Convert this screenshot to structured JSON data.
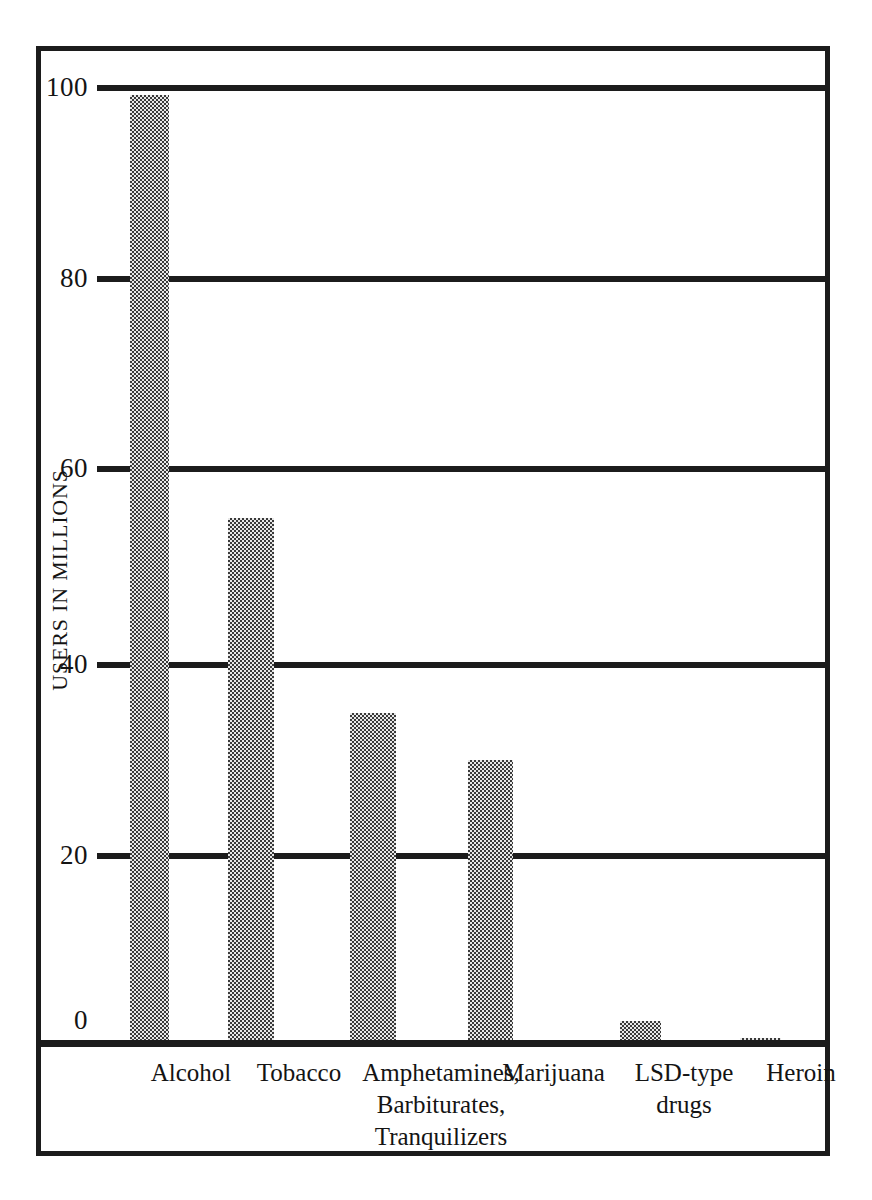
{
  "chart_data": {
    "type": "bar",
    "title": "",
    "subtitle": "",
    "xlabel": "",
    "ylabel": "USERS IN MILLIONS",
    "ylim": [
      0,
      100
    ],
    "yticks": [
      0,
      20,
      40,
      60,
      80,
      100
    ],
    "ytick_labels": [
      "0",
      "20",
      "40",
      "60",
      "80",
      "100"
    ],
    "grid": true,
    "legend": false,
    "legend_position": "none",
    "bar_fill": "checkerboard-dither-gray",
    "categories": [
      "Alcohol",
      "Tobacco",
      "Amphetamines, Barbiturates, Tranquilizers",
      "Marijuana",
      "LSD-type drugs",
      "Heroin"
    ],
    "category_label_lines": [
      [
        "Alcohol"
      ],
      [
        "Tobacco"
      ],
      [
        "Amphetamines,",
        "Barbiturates,",
        "Tranquilizers"
      ],
      [
        "Marijuana"
      ],
      [
        "LSD-type",
        "drugs"
      ],
      [
        "Heroin"
      ]
    ],
    "values": [
      99,
      54.8,
      34.5,
      29.5,
      2.3,
      0.5
    ],
    "units": "millions of users"
  },
  "colors": {
    "ink": "#1c1c1c",
    "bar_dark": "#3a3a3a",
    "bar_light": "#e8e8e8",
    "background": "#ffffff"
  }
}
